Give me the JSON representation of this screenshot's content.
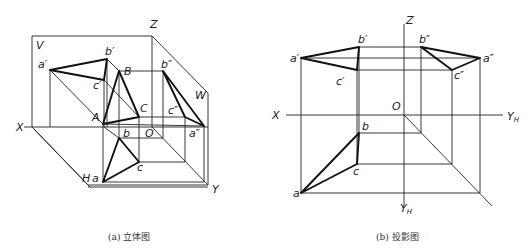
{
  "left_figure": {
    "caption": "(a) 立体图",
    "labels": {
      "V": "V",
      "Z": "Z",
      "W": "W",
      "X": "X",
      "H": "H",
      "Y": "Y",
      "O": "O",
      "a_prime": "a′",
      "b_prime": "b′",
      "c_prime": "c′",
      "A": "A",
      "B": "B",
      "C": "C",
      "a_dprime": "a″",
      "b_dprime": "b″",
      "c_dprime": "c″",
      "a": "a",
      "b": "b",
      "c": "c"
    }
  },
  "right_figure": {
    "caption": "(b) 投影图",
    "labels": {
      "Z": "Z",
      "X": "X",
      "O": "O",
      "YH_right": "Y",
      "YH_bottom": "Y",
      "YH_sub": "H",
      "a_prime": "a′",
      "b_prime": "b′",
      "c_prime": "c′",
      "a_dprime": "a″",
      "b_dprime": "b″",
      "c_dprime": "c″",
      "a": "a",
      "b": "b",
      "c": "c"
    }
  }
}
